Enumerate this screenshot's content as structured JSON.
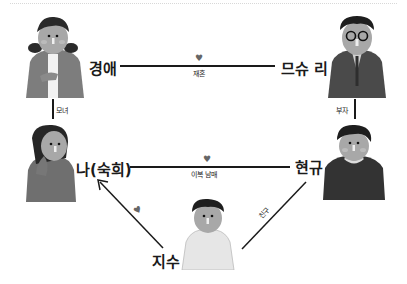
{
  "diagram": {
    "type": "family-relationship-chart",
    "people": [
      {
        "id": "gyeongae",
        "name": "경애",
        "figure": "older woman in grey cardigan"
      },
      {
        "id": "museuri",
        "name": "므슈 리",
        "figure": "older man with round glasses in suit"
      },
      {
        "id": "na",
        "name": "나(숙희)",
        "figure": "woman with hand on cheek"
      },
      {
        "id": "hyeongyu",
        "name": "현규",
        "figure": "man in dark sweater"
      },
      {
        "id": "jisu",
        "name": "지수",
        "figure": "man in white shirt"
      }
    ],
    "relations": [
      {
        "from": "경애",
        "to": "므슈 리",
        "label": "재혼",
        "heart": true
      },
      {
        "from": "경애",
        "to": "나(숙희)",
        "label": "모녀",
        "heart": false
      },
      {
        "from": "므슈 리",
        "to": "현규",
        "label": "부자",
        "heart": false
      },
      {
        "from": "나(숙희)",
        "to": "현규",
        "label": "이복 남매",
        "heart": true
      },
      {
        "from": "지수",
        "to": "나(숙희)",
        "label": "",
        "heart": true,
        "arrow": true
      },
      {
        "from": "지수",
        "to": "현규",
        "label": "친구",
        "heart": false
      }
    ]
  },
  "labels": {
    "gyeongae": "경애",
    "museuri": "므슈 리",
    "na": "나(숙희)",
    "hyeongyu": "현규",
    "jisu": "지수",
    "rel_remarriage": "재혼",
    "rel_mother_daughter": "모녀",
    "rel_father_son": "부자",
    "rel_half_siblings": "이복 남매",
    "rel_friend": "친구",
    "heart": "♥"
  },
  "colors": {
    "line": "#1a1a1a",
    "heart": "#666666",
    "background": "#ffffff"
  }
}
